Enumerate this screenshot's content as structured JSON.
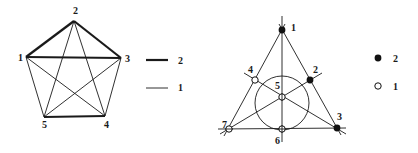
{
  "left_figure": {
    "title": "complete graph K5 with weighted edges",
    "vertices": [
      {
        "id": "1",
        "label": "1",
        "x": 26,
        "y": 57,
        "lx": 18,
        "ly": 61
      },
      {
        "id": "2",
        "label": "2",
        "x": 74,
        "y": 21,
        "lx": 73,
        "ly": 14
      },
      {
        "id": "3",
        "label": "3",
        "x": 121,
        "y": 58,
        "lx": 125,
        "ly": 62
      },
      {
        "id": "4",
        "label": "4",
        "x": 105,
        "y": 116,
        "lx": 104,
        "ly": 128
      },
      {
        "id": "5",
        "label": "5",
        "x": 44,
        "y": 117,
        "lx": 42,
        "ly": 128
      }
    ],
    "edges": [
      {
        "from": "1",
        "to": "2",
        "weight": 2
      },
      {
        "from": "2",
        "to": "3",
        "weight": 2
      },
      {
        "from": "1",
        "to": "3",
        "weight": 2
      },
      {
        "from": "5",
        "to": "4",
        "weight": 2
      },
      {
        "from": "1",
        "to": "5",
        "weight": 1
      },
      {
        "from": "1",
        "to": "4",
        "weight": 1
      },
      {
        "from": "2",
        "to": "5",
        "weight": 1
      },
      {
        "from": "2",
        "to": "4",
        "weight": 1
      },
      {
        "from": "3",
        "to": "5",
        "weight": 1
      },
      {
        "from": "3",
        "to": "4",
        "weight": 1
      }
    ],
    "legend": [
      {
        "style": "thick-line",
        "label": "2"
      },
      {
        "style": "thin-line",
        "label": "1"
      }
    ]
  },
  "right_figure": {
    "title": "Fano plane with weighted points",
    "points": [
      {
        "id": "1",
        "label": "1",
        "x": 282,
        "y": 30,
        "weight": 2,
        "lx": 291,
        "ly": 31
      },
      {
        "id": "2",
        "label": "2",
        "x": 310,
        "y": 80,
        "weight": 2,
        "lx": 313,
        "ly": 73
      },
      {
        "id": "3",
        "label": "3",
        "x": 337,
        "y": 128,
        "weight": 2,
        "lx": 337,
        "ly": 120
      },
      {
        "id": "4",
        "label": "4",
        "x": 255,
        "y": 80,
        "weight": 1,
        "lx": 248,
        "ly": 73
      },
      {
        "id": "5",
        "label": "5",
        "x": 282,
        "y": 97,
        "weight": 1,
        "lx": 275,
        "ly": 89
      },
      {
        "id": "6",
        "label": "6",
        "x": 282,
        "y": 129,
        "weight": 1,
        "lx": 275,
        "ly": 144
      },
      {
        "id": "7",
        "label": "7",
        "x": 229,
        "y": 129,
        "weight": 1,
        "lx": 223,
        "ly": 128
      }
    ],
    "lines": [
      {
        "points": [
          "1",
          "4",
          "7"
        ]
      },
      {
        "points": [
          "1",
          "2",
          "3"
        ]
      },
      {
        "points": [
          "7",
          "6",
          "3"
        ]
      },
      {
        "points": [
          "1",
          "5",
          "6"
        ]
      },
      {
        "points": [
          "4",
          "5",
          "3"
        ]
      },
      {
        "points": [
          "7",
          "5",
          "2"
        ]
      },
      {
        "points": [
          "4",
          "2",
          "6"
        ],
        "shape": "circle"
      }
    ],
    "legend": [
      {
        "style": "filled-dot",
        "label": "2"
      },
      {
        "style": "hollow-dot",
        "label": "1"
      }
    ]
  }
}
